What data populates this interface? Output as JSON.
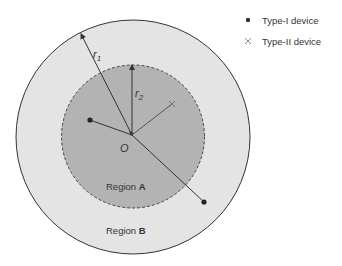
{
  "diagram": {
    "outer_region": {
      "label_prefix": "Region ",
      "label_bold": "B",
      "fill": "#e4e4e4",
      "stroke": "#333333"
    },
    "inner_region": {
      "label_prefix": "Region ",
      "label_bold": "A",
      "fill": "#b3b3b3",
      "stroke": "#444444",
      "dashed": true
    },
    "center_label": "O",
    "radius_outer_label": "r",
    "radius_outer_sub": "1",
    "radius_inner_label": "r",
    "radius_inner_sub": "2",
    "devices": [
      {
        "type": "Type-I",
        "marker": "dot",
        "x": 90,
        "y": 120
      },
      {
        "type": "Type-I",
        "marker": "dot",
        "x": 204,
        "y": 202
      },
      {
        "type": "Type-II",
        "marker": "cross",
        "x": 172,
        "y": 104
      }
    ]
  },
  "legend": {
    "items": [
      {
        "marker": "dot",
        "label": "Type-I device"
      },
      {
        "marker": "cross",
        "label": "Type-II device"
      }
    ]
  }
}
